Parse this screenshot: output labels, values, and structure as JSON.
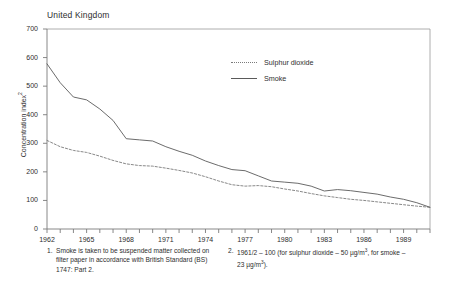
{
  "chart_data": {
    "type": "line",
    "title": "United Kingdom",
    "xlabel": "",
    "ylabel": "Concentration index",
    "ylabel_footnote_marker": "2",
    "ylim": [
      0,
      700
    ],
    "ytick_values": [
      0,
      100,
      200,
      300,
      400,
      500,
      600,
      700
    ],
    "ytick_labels": [
      "0",
      "100",
      "200",
      "300",
      "400",
      "500",
      "600",
      "700"
    ],
    "xlim": [
      1962,
      1991
    ],
    "xtick_values": [
      1962,
      1963,
      1964,
      1965,
      1966,
      1967,
      1968,
      1969,
      1970,
      1971,
      1972,
      1973,
      1974,
      1975,
      1976,
      1977,
      1978,
      1979,
      1980,
      1981,
      1982,
      1983,
      1984,
      1985,
      1986,
      1987,
      1988,
      1989,
      1990,
      1991
    ],
    "xtick_labels": [
      "1962",
      "1965",
      "1968",
      "1971",
      "1974",
      "1977",
      "1980",
      "1983",
      "1986",
      "1989"
    ],
    "xtick_labelled_values": [
      1962,
      1965,
      1968,
      1971,
      1974,
      1977,
      1980,
      1983,
      1986,
      1989
    ],
    "grid": false,
    "legend_position": "top-center-right",
    "x": [
      1962,
      1963,
      1964,
      1965,
      1966,
      1967,
      1968,
      1969,
      1970,
      1971,
      1972,
      1973,
      1974,
      1975,
      1976,
      1977,
      1978,
      1979,
      1980,
      1981,
      1982,
      1983,
      1984,
      1985,
      1986,
      1987,
      1988,
      1989,
      1990,
      1991
    ],
    "series": [
      {
        "name": "Sulphur dioxide",
        "style": "dotted",
        "color": "#7a7a7a",
        "values": [
          310,
          288,
          275,
          268,
          255,
          240,
          228,
          222,
          220,
          213,
          205,
          196,
          183,
          168,
          155,
          150,
          152,
          148,
          140,
          133,
          124,
          116,
          110,
          104,
          100,
          95,
          90,
          85,
          80,
          76
        ]
      },
      {
        "name": "Smoke",
        "style": "solid",
        "color": "#5a5a5a",
        "values": [
          578,
          512,
          462,
          452,
          420,
          380,
          316,
          312,
          308,
          288,
          272,
          258,
          238,
          222,
          208,
          204,
          186,
          168,
          164,
          160,
          150,
          133,
          138,
          134,
          128,
          122,
          112,
          104,
          92,
          76
        ]
      }
    ]
  },
  "legend": {
    "items": [
      {
        "label": "Sulphur dioxide",
        "style": "dotted",
        "color": "#7a7a7a"
      },
      {
        "label": "Smoke",
        "style": "solid",
        "color": "#5a5a5a"
      }
    ]
  },
  "footnotes": [
    {
      "number": "1.",
      "text": "Smoke is taken to be suspended matter collected on filter paper in accordance with British Standard (BS) 1747: Part 2."
    },
    {
      "number": "2.",
      "text": "1961/2 – 100 (for sulphur dioxide – 50 µg/m³, for smoke – 23 µg/m³)."
    }
  ]
}
